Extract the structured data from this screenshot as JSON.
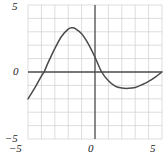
{
  "chart_data": {
    "type": "line",
    "title": "",
    "subtitle": "",
    "xlabel": "",
    "ylabel": "",
    "xlim": [
      -5,
      5
    ],
    "ylim": [
      -5,
      5
    ],
    "grid": true,
    "grid_step": 1,
    "legend": "none",
    "axes": {
      "x_axis_at_y": 0,
      "y_axis_at_x": 0
    },
    "x_ticks": [
      -5,
      0,
      5
    ],
    "x_tick_labels": [
      "-5",
      "0",
      "5"
    ],
    "y_ticks": [
      -5,
      0,
      5
    ],
    "y_tick_labels": [
      "-5",
      "0",
      "5"
    ],
    "series": [
      {
        "name": "curve",
        "color": "#4a4a4a",
        "x": [
          -5.0,
          -4.5,
          -4.0,
          -3.8,
          -3.5,
          -3.0,
          -2.5,
          -2.0,
          -1.7,
          -1.5,
          -1.0,
          -0.5,
          0.0,
          0.5,
          1.0,
          1.5,
          2.0,
          2.5,
          3.0,
          3.5,
          4.0,
          4.5,
          5.0
        ],
        "y": [
          -2.0,
          -1.2,
          -0.3,
          0.0,
          0.7,
          1.75,
          2.65,
          3.2,
          3.3,
          3.25,
          2.85,
          2.1,
          1.1,
          0.0,
          -0.65,
          -1.05,
          -1.2,
          -1.22,
          -1.15,
          -0.95,
          -0.7,
          -0.38,
          0.0
        ]
      }
    ],
    "annotations": {
      "peak": {
        "x": -1.7,
        "y": 3.3
      },
      "trough": {
        "x": 2.5,
        "y": -1.22
      },
      "x_intercepts": [
        -3.8,
        0.5,
        5.0
      ],
      "left_endpoint": {
        "x": -5,
        "y": -2.0
      },
      "right_endpoint": {
        "x": 5,
        "y": 0.0
      }
    }
  },
  "labels": {
    "y_top": "5",
    "y_zero": "0",
    "y_bottom": "−5",
    "x_left": "−5",
    "x_zero": "0",
    "x_right": "5"
  },
  "caption": {
    "text": ""
  },
  "colors": {
    "curve": "#4a4a4a",
    "axis": "#4a4a4a",
    "grid": "#cfcfcf",
    "background": "#ffffff",
    "text": "#1b1b1b"
  }
}
